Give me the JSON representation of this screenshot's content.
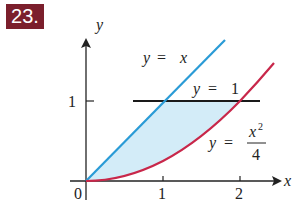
{
  "problem_number": "23.",
  "axes": {
    "x_label": "x",
    "y_label": "y",
    "origin_label": "0",
    "x_ticks": [
      "1",
      "2"
    ],
    "y_ticks": [
      "1"
    ]
  },
  "curves": [
    {
      "name": "line y=x",
      "label_lhs": "y",
      "label_eq": "=",
      "label_rhs": "x",
      "color": "#2a9bd6"
    },
    {
      "name": "line y=1",
      "label_lhs": "y",
      "label_eq": "=",
      "label_rhs": "1",
      "color": "#1a1a1a"
    },
    {
      "name": "parabola y=x^2/4",
      "label_lhs": "y",
      "label_eq": "=",
      "label_num": "x",
      "label_exp": "2",
      "label_den": "4",
      "color": "#c8274a"
    }
  ],
  "region_fill": "#d3ecf8"
}
